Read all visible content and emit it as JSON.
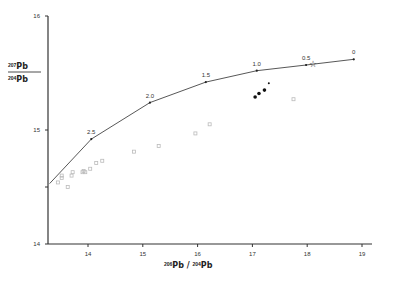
{
  "chart_data": {
    "type": "scatter",
    "title": "",
    "xlabel": "206Pb / 204Pb",
    "ylabel": "207Pb / 204Pb",
    "xlim": [
      13.3,
      19.3
    ],
    "ylim": [
      14,
      16
    ],
    "x_ticks": [
      "14",
      "15",
      "16",
      "17",
      "18",
      "19"
    ],
    "y_ticks": [
      "14",
      "15",
      "16"
    ],
    "grid": false,
    "growth_curve": {
      "name": "Pb growth curve (Ga)",
      "points": [
        {
          "x": 13.3,
          "y": 14.53,
          "label": ""
        },
        {
          "x": 14.06,
          "y": 14.92,
          "label": "2.5"
        },
        {
          "x": 15.13,
          "y": 15.24,
          "label": "2.0"
        },
        {
          "x": 16.15,
          "y": 15.42,
          "label": "1.5"
        },
        {
          "x": 17.08,
          "y": 15.52,
          "label": "1.0"
        },
        {
          "x": 17.98,
          "y": 15.57,
          "label": "0.5"
        },
        {
          "x": 18.85,
          "y": 15.62,
          "label": "0"
        }
      ]
    },
    "series": [
      {
        "name": "filled circles",
        "color": "#111111",
        "points": [
          [
            17.05,
            15.29
          ],
          [
            17.12,
            15.32
          ],
          [
            17.22,
            15.35
          ],
          [
            17.3,
            15.41
          ]
        ]
      },
      {
        "name": "open squares (light)",
        "color": "#bbbbbb",
        "points": [
          [
            13.45,
            14.54
          ],
          [
            13.52,
            14.6
          ],
          [
            13.52,
            14.58
          ],
          [
            13.63,
            14.5
          ],
          [
            13.7,
            14.6
          ],
          [
            13.72,
            14.63
          ],
          [
            13.9,
            14.63
          ],
          [
            13.92,
            14.64
          ],
          [
            13.95,
            14.63
          ],
          [
            14.04,
            14.66
          ],
          [
            14.15,
            14.71
          ],
          [
            14.26,
            14.73
          ],
          [
            14.84,
            14.81
          ],
          [
            15.29,
            14.86
          ],
          [
            15.96,
            14.97
          ],
          [
            16.22,
            15.05
          ],
          [
            17.75,
            15.27
          ]
        ]
      },
      {
        "name": "star (present-day)",
        "color": "#111111",
        "points": [
          [
            18.1,
            15.58
          ]
        ]
      }
    ]
  }
}
